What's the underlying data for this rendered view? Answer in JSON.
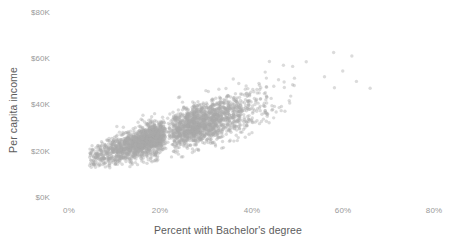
{
  "chart_data": {
    "type": "scatter",
    "title": "",
    "xlabel": "Percent with Bachelor's degree",
    "ylabel": "Per capita income",
    "xlim": [
      0,
      80
    ],
    "ylim": [
      0,
      80000
    ],
    "grid": false,
    "legend": null,
    "xticks": [
      0,
      20,
      40,
      60,
      80
    ],
    "xticklabels": [
      "0%",
      "20%",
      "40%",
      "60%",
      "80%"
    ],
    "yticks": [
      0,
      20000,
      40000,
      60000,
      80000
    ],
    "yticklabels": [
      "$0K",
      "$20K",
      "$40K",
      "$60K",
      "$80K"
    ],
    "marker": {
      "color": "#a9a9a9",
      "opacity": 0.42,
      "radius_px": 1.7,
      "shape": "circle"
    },
    "n_points": 3100,
    "distribution": {
      "x_mean": 21.5,
      "x_sd": 8.2,
      "x_min": 4.5,
      "x_max": 66,
      "y_intercept": 13800,
      "y_slope_per_x_percent": 620,
      "y_residual_sd": 3600,
      "y_min": 9000,
      "y_max": 64000
    },
    "outliers": [
      {
        "x": 43,
        "y": 54000
      },
      {
        "x": 47,
        "y": 57000
      },
      {
        "x": 52,
        "y": 58500
      },
      {
        "x": 56,
        "y": 52000
      },
      {
        "x": 60,
        "y": 54500
      },
      {
        "x": 63,
        "y": 50000
      },
      {
        "x": 66,
        "y": 47000
      },
      {
        "x": 36,
        "y": 51000
      },
      {
        "x": 30,
        "y": 46000
      },
      {
        "x": 24,
        "y": 43000
      },
      {
        "x": 58,
        "y": 62500
      },
      {
        "x": 62,
        "y": 61000
      }
    ]
  },
  "axes": {
    "x_title": "Percent with Bachelor's degree",
    "y_title": "Per capita income",
    "x_tick_labels": [
      "0%",
      "20%",
      "40%",
      "60%",
      "80%"
    ],
    "y_tick_labels": [
      "$80K",
      "$60K",
      "$40K",
      "$20K",
      "$0K"
    ]
  },
  "colors": {
    "background": "#ffffff",
    "point": "#a9a9a9",
    "tick_text": "#9a9a9a",
    "axis_title_text": "#5c5c5c"
  }
}
